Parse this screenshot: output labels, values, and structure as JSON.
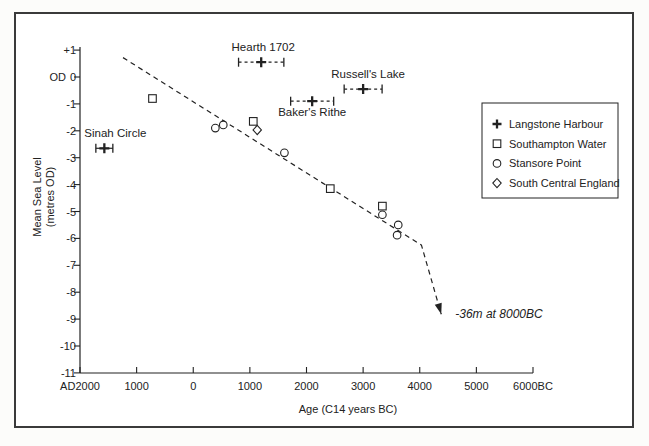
{
  "figure": {
    "background": "#ffffff",
    "frame_color": "#3a3a3a",
    "ink_color": "#222222"
  },
  "chart_data": {
    "type": "scatter",
    "title": "",
    "xlabel": "Age (C14 years BC)",
    "ylabel_lines": [
      "Mean Sea Level",
      "(metres OD)"
    ],
    "od_label": "OD",
    "x_axis": {
      "min": -2000,
      "max": 6000,
      "ticks": [
        {
          "value": -2000,
          "label": "AD2000"
        },
        {
          "value": -1000,
          "label": "1000"
        },
        {
          "value": 0,
          "label": "0"
        },
        {
          "value": 1000,
          "label": "1000"
        },
        {
          "value": 2000,
          "label": "2000"
        },
        {
          "value": 3000,
          "label": "3000"
        },
        {
          "value": 4000,
          "label": "4000"
        },
        {
          "value": 5000,
          "label": "5000"
        },
        {
          "value": 6000,
          "label": "6000BC"
        }
      ]
    },
    "y_axis": {
      "min": -11,
      "max": 1,
      "ticks": [
        {
          "value": 1,
          "label": "+1"
        },
        {
          "value": 0,
          "label": "0"
        },
        {
          "value": -1,
          "label": "-1"
        },
        {
          "value": -2,
          "label": "-2"
        },
        {
          "value": -3,
          "label": "-3"
        },
        {
          "value": -4,
          "label": "-4"
        },
        {
          "value": -5,
          "label": "-5"
        },
        {
          "value": -6,
          "label": "-6"
        },
        {
          "value": -7,
          "label": "-7"
        },
        {
          "value": -8,
          "label": "-8"
        },
        {
          "value": -9,
          "label": "-9"
        },
        {
          "value": -10,
          "label": "-10"
        },
        {
          "value": -11,
          "label": "-11"
        }
      ]
    },
    "series": [
      {
        "name": "Langstone Harbour",
        "marker": "plus",
        "points": [
          {
            "x": -1570,
            "y": -2.65,
            "xerr": 150,
            "bar": "solid",
            "label": "Sinah Circle",
            "label_pos": "above",
            "label_dx": 11
          },
          {
            "x": 1200,
            "y": 0.55,
            "xerr": 400,
            "bar": "dashed",
            "label": "Hearth 1702",
            "label_pos": "above",
            "label_dx": 2
          },
          {
            "x": 2100,
            "y": -0.9,
            "xerr": 380,
            "bar": "dashed",
            "label": "Baker's Rithe",
            "label_pos": "below",
            "label_dx": 0
          },
          {
            "x": 3000,
            "y": -0.45,
            "xerr": 335,
            "bar": "dashed",
            "label": "Russell's Lake",
            "label_pos": "above",
            "label_dx": 5
          }
        ]
      },
      {
        "name": "Southampton Water",
        "marker": "square",
        "points": [
          {
            "x": -720,
            "y": -0.8
          },
          {
            "x": 1060,
            "y": -1.65
          },
          {
            "x": 2420,
            "y": -4.15
          },
          {
            "x": 3340,
            "y": -4.8
          }
        ]
      },
      {
        "name": "Stansore Point",
        "marker": "circle",
        "points": [
          {
            "x": 390,
            "y": -1.9
          },
          {
            "x": 530,
            "y": -1.78
          },
          {
            "x": 1610,
            "y": -2.82
          },
          {
            "x": 3340,
            "y": -5.12
          },
          {
            "x": 3620,
            "y": -5.5
          },
          {
            "x": 3600,
            "y": -5.88
          }
        ]
      },
      {
        "name": "South Central England",
        "marker": "diamond",
        "points": [
          {
            "x": 1130,
            "y": -1.97
          }
        ]
      }
    ],
    "trend": {
      "style": "dashed",
      "points": [
        {
          "x": -1240,
          "y": 0.72
        },
        {
          "x": 4030,
          "y": -6.25
        },
        {
          "x": 4380,
          "y": -8.82
        }
      ],
      "annotation": "-36m at 8000BC"
    },
    "legend": {
      "position": "right",
      "items": [
        {
          "marker": "plus",
          "label": "Langstone Harbour"
        },
        {
          "marker": "square",
          "label": "Southampton Water"
        },
        {
          "marker": "circle",
          "label": "Stansore Point"
        },
        {
          "marker": "diamond",
          "label": "South Central England"
        }
      ]
    }
  }
}
